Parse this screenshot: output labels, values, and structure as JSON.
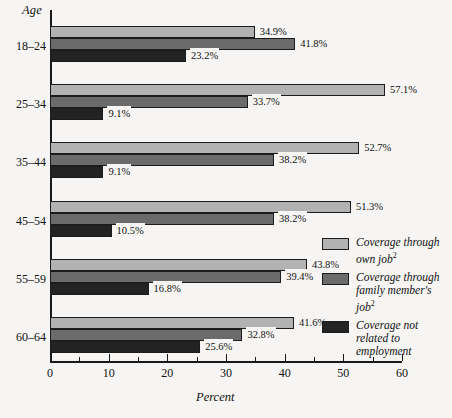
{
  "chart_data": {
    "type": "bar",
    "orientation": "horizontal",
    "title": "",
    "xlabel": "Percent",
    "ylabel": "Age",
    "xlim": [
      0,
      60
    ],
    "xticks": [
      0,
      10,
      20,
      30,
      40,
      50,
      60
    ],
    "xtick_labels": [
      "0",
      "10",
      "20",
      "30",
      "40",
      "50",
      "60"
    ],
    "minor_xticks": [
      5,
      15,
      25,
      35,
      45,
      55
    ],
    "grid": false,
    "legend_position": "right",
    "categories": [
      "18–24",
      "25–34",
      "35–44",
      "45–54",
      "55–59",
      "60–64"
    ],
    "series": [
      {
        "name": "Coverage through own job",
        "color": "#b2b2b2",
        "values": [
          34.9,
          57.1,
          52.7,
          51.3,
          43.8,
          41.6
        ],
        "labels": [
          "34.9%",
          "57.1%",
          "52.7%",
          "51.3%",
          "43.8%",
          "41.6%"
        ]
      },
      {
        "name": "Coverage through family member's job",
        "color": "#6b6b6b",
        "values": [
          41.8,
          33.7,
          38.2,
          38.2,
          39.4,
          32.8
        ],
        "labels": [
          "41.8%",
          "33.7%",
          "38.2%",
          "38.2%",
          "39.4%",
          "32.8%"
        ]
      },
      {
        "name": "Coverage not related to employment",
        "color": "#232323",
        "values": [
          23.2,
          9.1,
          9.1,
          10.5,
          16.8,
          25.6
        ],
        "labels": [
          "23.2%",
          "9.1%",
          "9.1%",
          "10.5%",
          "16.8%",
          "25.6%"
        ]
      }
    ]
  },
  "axes": {
    "y_title": "Age",
    "x_title": "Percent"
  },
  "legend": {
    "items": [
      {
        "line1": "Coverage through",
        "line2": "own job",
        "sup": "2",
        "line3": "",
        "color": "#b2b2b2"
      },
      {
        "line1": "Coverage through",
        "line2": "family member's",
        "line3": "job",
        "sup": "2",
        "color": "#6b6b6b"
      },
      {
        "line1": "Coverage not",
        "line2": "related to",
        "line3": "employment",
        "sup": "",
        "color": "#232323"
      }
    ]
  },
  "colors": {
    "series_light": "#b2b2b2",
    "series_medium": "#6b6b6b",
    "series_dark": "#232323",
    "axis": "#1a1a1a",
    "background": "#f6f5f3"
  }
}
